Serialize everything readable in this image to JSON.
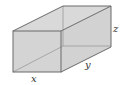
{
  "diagram": {
    "colors": {
      "face_fill": "#d4d4d4",
      "edge": "#6a6a6a",
      "hidden_edge": "#9a9a9a",
      "label": "#333333"
    },
    "labels": {
      "x": "x",
      "y": "y",
      "z": "z"
    }
  }
}
